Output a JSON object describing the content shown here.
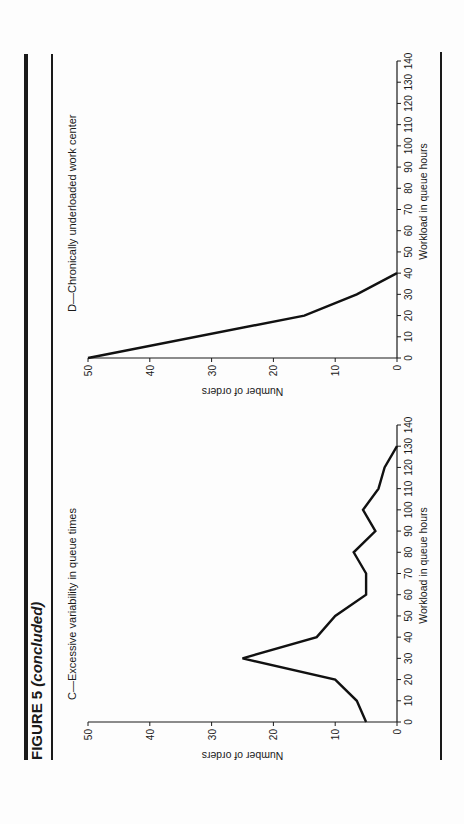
{
  "figure": {
    "title_main": "FIGURE 5",
    "title_suffix": "(concluded)"
  },
  "panels": [
    {
      "id": "C",
      "subtitle": "C—Excessive variability in queue times",
      "xlabel": "Workload in queue hours",
      "ylabel": "Number of orders"
    },
    {
      "id": "D",
      "subtitle": "D—Chronically underloaded work center",
      "xlabel": "Workload in queue hours",
      "ylabel": "Number of orders"
    }
  ],
  "chart_data": [
    {
      "type": "line",
      "title": "C—Excessive variability in queue times",
      "xlabel": "Workload in queue hours",
      "ylabel": "Number of orders",
      "x": [
        0,
        10,
        20,
        30,
        40,
        50,
        60,
        70,
        80,
        90,
        100,
        110,
        120,
        130
      ],
      "y": [
        5,
        6.5,
        10,
        25,
        13,
        10,
        5,
        5,
        7,
        3.5,
        5.5,
        3,
        2,
        0
      ],
      "xlim": [
        0,
        140
      ],
      "ylim": [
        0,
        50
      ],
      "xticks": [
        0,
        10,
        20,
        30,
        40,
        50,
        60,
        70,
        80,
        90,
        100,
        110,
        120,
        130,
        140
      ],
      "yticks": [
        0,
        10,
        20,
        30,
        40,
        50
      ],
      "grid": false,
      "legend": null
    },
    {
      "type": "line",
      "title": "D—Chronically underloaded work center",
      "xlabel": "Workload in queue hours",
      "ylabel": "Number of orders",
      "x": [
        0,
        20,
        30,
        40
      ],
      "y": [
        50,
        15,
        6.5,
        0
      ],
      "xlim": [
        0,
        140
      ],
      "ylim": [
        0,
        50
      ],
      "xticks": [
        0,
        10,
        20,
        30,
        40,
        50,
        60,
        70,
        80,
        90,
        100,
        110,
        120,
        130,
        140
      ],
      "yticks": [
        0,
        10,
        20,
        30,
        40,
        50
      ],
      "grid": false,
      "legend": null
    }
  ]
}
